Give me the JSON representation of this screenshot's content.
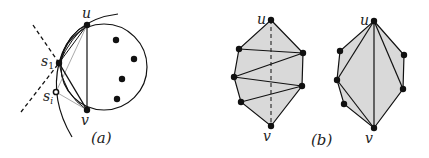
{
  "figure": {
    "panel_a": {
      "caption": "(a)",
      "labels": {
        "u": "u",
        "s1": "s",
        "s1_sub": "1",
        "si": "s",
        "si_sub": "i",
        "v": "v"
      },
      "points": {
        "u": [
          87,
          25
        ],
        "s1": [
          59,
          63
        ],
        "si": [
          56,
          92
        ],
        "v": [
          87,
          110
        ]
      },
      "circle": {
        "cx": 104,
        "cy": 67,
        "r": 43
      },
      "interior_dots": [
        [
          116,
          40
        ],
        [
          134,
          59
        ],
        [
          122,
          79
        ],
        [
          117,
          99
        ]
      ]
    },
    "panel_b": {
      "caption": "(b)",
      "left": {
        "labels": {
          "u": "u",
          "v": "v"
        },
        "points": {
          "u": [
            271,
            20
          ],
          "l1": [
            239,
            49
          ],
          "r1": [
            303,
            53
          ],
          "l2": [
            234,
            77
          ],
          "r2": [
            302,
            86
          ],
          "l3": [
            241,
            102
          ],
          "v": [
            271,
            126
          ]
        }
      },
      "right": {
        "labels": {
          "u": "u",
          "v": "v"
        },
        "points": {
          "u": [
            374,
            21
          ],
          "l1": [
            340,
            51
          ],
          "r1": [
            404,
            55
          ],
          "l2": [
            337,
            80
          ],
          "r2": [
            403,
            89
          ],
          "l3": [
            344,
            104
          ],
          "v": [
            374,
            128
          ]
        }
      }
    },
    "colors": {
      "stroke": "#111111",
      "fill": "#d9d9d9",
      "light_stroke": "#aaaaaa"
    }
  }
}
